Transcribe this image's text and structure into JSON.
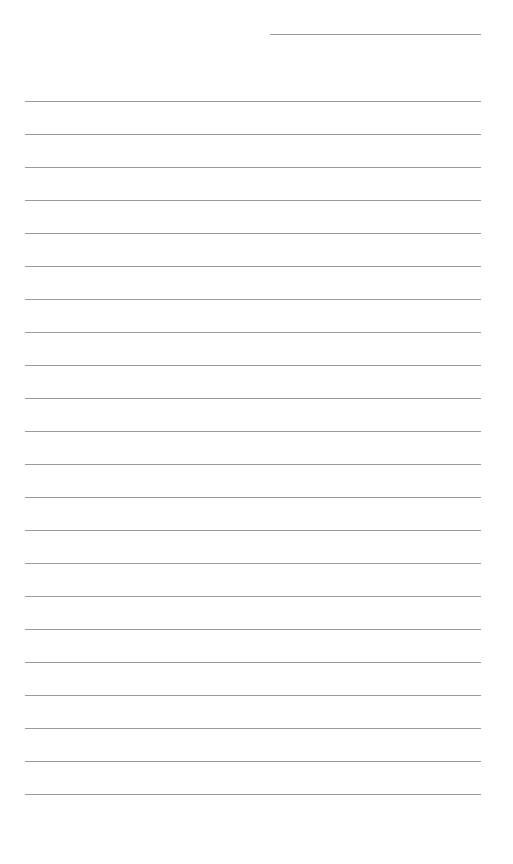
{
  "document": {
    "type": "lined-paper",
    "header_line": {
      "label": ""
    },
    "rule_count": 22,
    "rules": [
      "",
      "",
      "",
      "",
      "",
      "",
      "",
      "",
      "",
      "",
      "",
      "",
      "",
      "",
      "",
      "",
      "",
      "",
      "",
      "",
      "",
      ""
    ],
    "line_color": "#9a9a9a",
    "background_color": "#ffffff"
  }
}
